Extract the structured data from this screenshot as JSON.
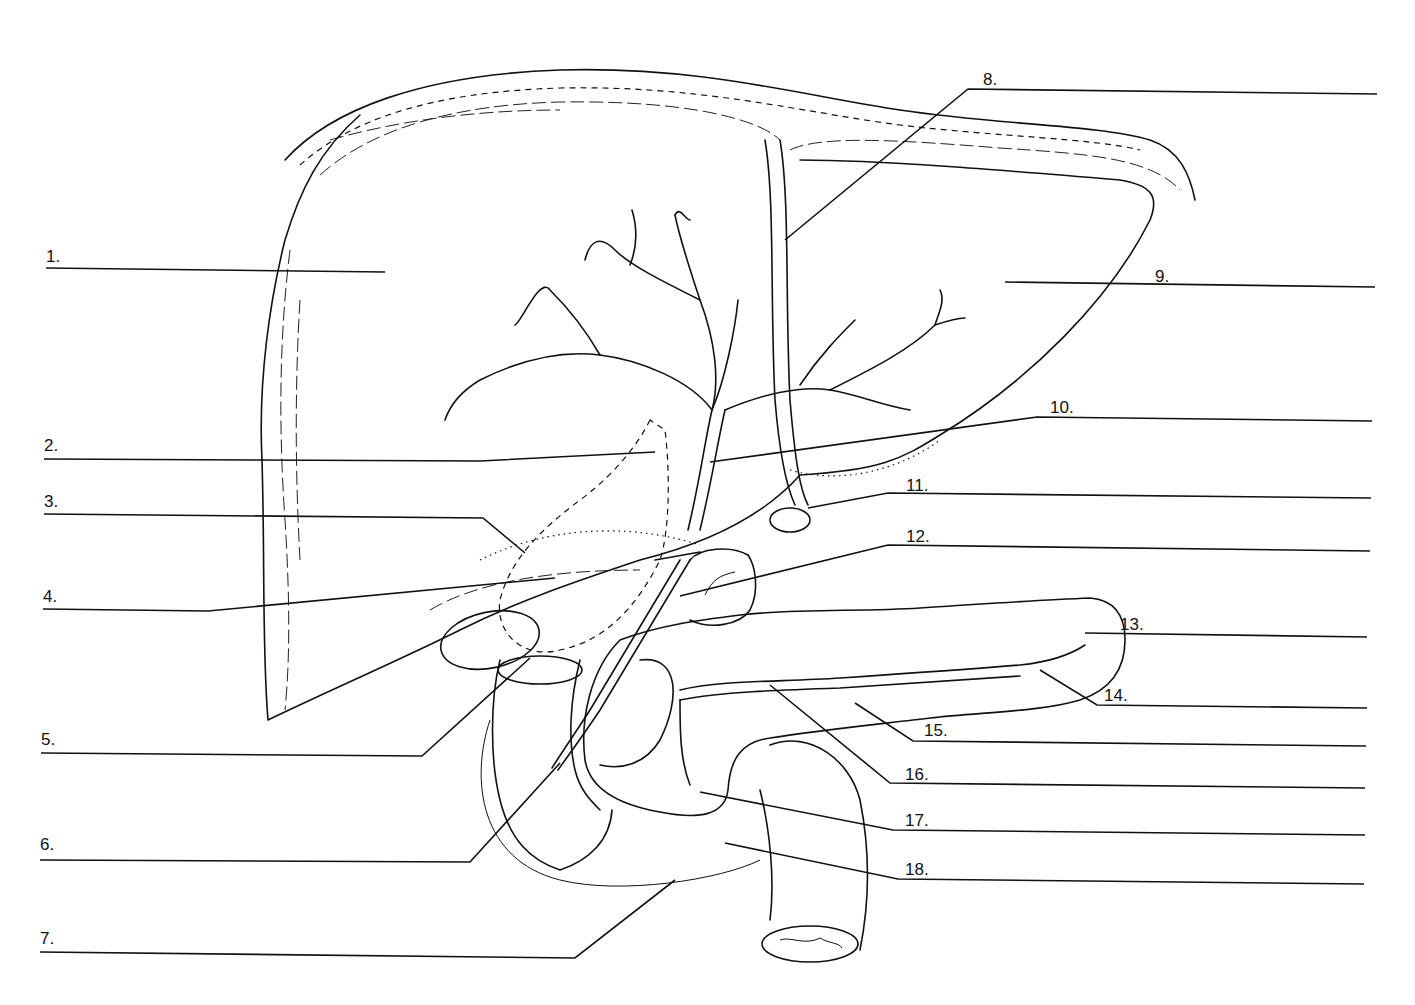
{
  "diagram": {
    "labels": [
      {
        "id": 1,
        "text": "1.",
        "side": "left",
        "x": 46,
        "y": 248
      },
      {
        "id": 2,
        "text": "2.",
        "side": "left",
        "x": 44,
        "y": 437
      },
      {
        "id": 3,
        "text": "3.",
        "side": "left",
        "x": 44,
        "y": 493
      },
      {
        "id": 4,
        "text": "4.",
        "side": "left",
        "x": 43,
        "y": 588
      },
      {
        "id": 5,
        "text": "5.",
        "side": "left",
        "x": 41,
        "y": 731
      },
      {
        "id": 6,
        "text": "6.",
        "side": "left",
        "x": 40,
        "y": 836
      },
      {
        "id": 7,
        "text": "7.",
        "side": "left",
        "x": 40,
        "y": 930
      },
      {
        "id": 8,
        "text": "8.",
        "side": "right",
        "x": 983,
        "y": 71
      },
      {
        "id": 9,
        "text": "9.",
        "side": "right",
        "x": 1155,
        "y": 268
      },
      {
        "id": 10,
        "text": "10.",
        "side": "right",
        "x": 1050,
        "y": 399
      },
      {
        "id": 11,
        "text": "11.",
        "side": "right",
        "x": 906,
        "y": 477
      },
      {
        "id": 12,
        "text": "12.",
        "side": "right",
        "x": 906,
        "y": 528
      },
      {
        "id": 13,
        "text": "13.",
        "side": "right",
        "x": 1120,
        "y": 616
      },
      {
        "id": 14,
        "text": "14.",
        "side": "right",
        "x": 1104,
        "y": 687
      },
      {
        "id": 15,
        "text": "15.",
        "side": "right",
        "x": 924,
        "y": 722
      },
      {
        "id": 16,
        "text": "16.",
        "side": "right",
        "x": 905,
        "y": 766
      },
      {
        "id": 17,
        "text": "17.",
        "side": "right",
        "x": 905,
        "y": 812
      },
      {
        "id": 18,
        "text": "18.",
        "side": "right",
        "x": 905,
        "y": 861
      }
    ],
    "answer_lines_count": 18
  }
}
